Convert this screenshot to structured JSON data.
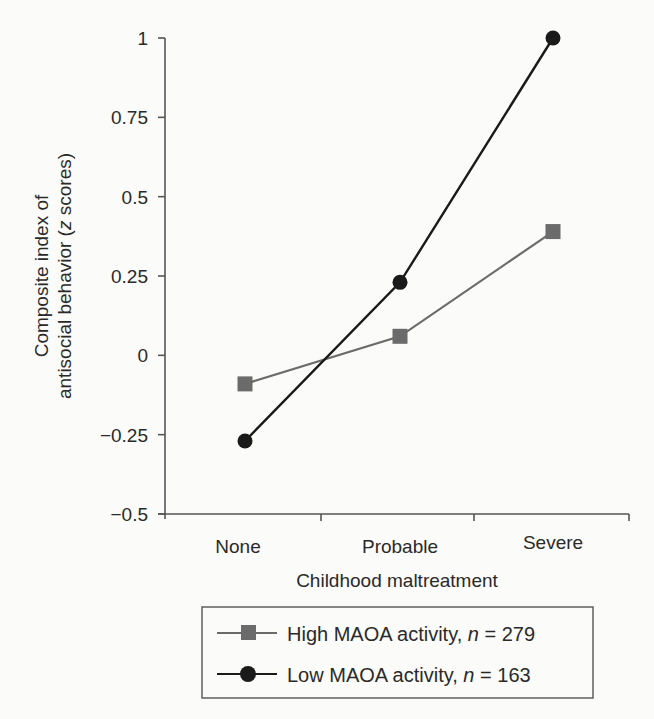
{
  "chart_data": {
    "type": "line",
    "title": "",
    "xlabel": "Childhood maltreatment",
    "ylabel_line1": "Composite index of",
    "ylabel_line2_pre": "antisocial behavior (",
    "ylabel_line2_italic": "z",
    "ylabel_line2_post": " scores)",
    "categories": [
      "None",
      "Probable",
      "Severe"
    ],
    "ylim": [
      -0.5,
      1
    ],
    "yticks": [
      1,
      0.75,
      0.5,
      0.25,
      0,
      -0.25,
      -0.5
    ],
    "ytick_labels": [
      "1",
      "0.75",
      "0.5",
      "0.25",
      "0",
      "−0.25",
      "−0.5"
    ],
    "grid": false,
    "legend_position": "bottom-center, below x-axis title",
    "series": [
      {
        "name": "High MAOA activity, n = 279",
        "label_pre": "High MAOA activity, ",
        "label_n": "n",
        "label_post": " = 279",
        "marker": "square",
        "color": "#6b6b6b",
        "values": [
          -0.09,
          0.06,
          0.39
        ]
      },
      {
        "name": "Low MAOA activity, n = 163",
        "label_pre": "Low MAOA activity, ",
        "label_n": "n",
        "label_post": " = 163",
        "marker": "circle",
        "color": "#1a1a1a",
        "values": [
          -0.27,
          0.23,
          1.0
        ]
      }
    ]
  }
}
